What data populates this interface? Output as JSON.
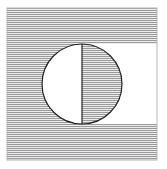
{
  "diagram": {
    "square": {
      "x": 7,
      "y": 8,
      "width": 150,
      "height": 152
    },
    "circle": {
      "cx": 82,
      "cy": 84,
      "r": 40
    },
    "divider": {
      "x": 82
    },
    "white_band": {
      "y_top": 44,
      "y_bottom": 124
    },
    "colors": {
      "hatch_line": "#9a9a9a",
      "hatch_bg": "#ececec",
      "stroke": "#222222",
      "border": "#8a8a8a",
      "background": "#ffffff"
    }
  }
}
